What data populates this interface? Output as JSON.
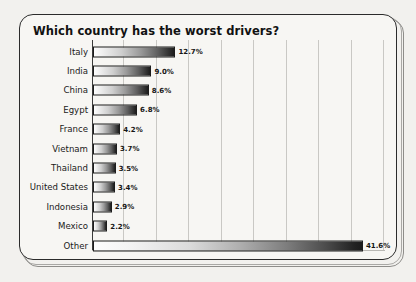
{
  "chart_data": {
    "type": "bar",
    "orientation": "horizontal",
    "title": "Which country has the worst drivers?",
    "xlabel": "",
    "ylabel": "",
    "categories": [
      "Italy",
      "India",
      "China",
      "Egypt",
      "France",
      "Vietnam",
      "Thailand",
      "United States",
      "Indonesia",
      "Mexico",
      "Other"
    ],
    "values": [
      12.7,
      9.0,
      8.6,
      6.8,
      4.2,
      3.7,
      3.5,
      3.4,
      2.9,
      2.2,
      41.6
    ],
    "value_labels": [
      "12.7%",
      "9.0%",
      "8.6%",
      "6.8%",
      "4.2%",
      "3.7%",
      "3.5%",
      "3.4%",
      "2.9%",
      "2.2%",
      "41.6%"
    ],
    "xlim": [
      0,
      45
    ],
    "gridlines": [
      5,
      10,
      15,
      20,
      25,
      30,
      35,
      40,
      45
    ],
    "grid": true,
    "legend": "none",
    "bar_style": "white-to-black horizontal gradient with thin black outline"
  },
  "colors": {
    "page_background": "#f2f1ee",
    "card_background": "#f7f6f3",
    "frame_border": "#2b2b2b",
    "frame_shadow": "#8e8d8a",
    "gridline": "#c9c8c4",
    "axis": "#3a3a3a",
    "text": "#1a1a1a",
    "title_text": "#111111",
    "bar_light": "#fdfdfd",
    "bar_dark": "#1b1b1b"
  }
}
